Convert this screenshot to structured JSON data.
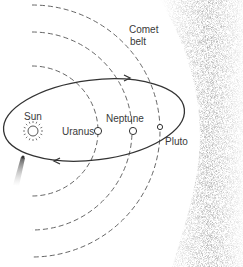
{
  "diagram": {
    "labels": {
      "sun": "Sun",
      "uranus": "Uranus",
      "neptune": "Neptune",
      "pluto": "Pluto",
      "comet_belt_line1": "Comet",
      "comet_belt_line2": "belt"
    },
    "colors": {
      "line": "#333333",
      "dashed_orbit": "#555555",
      "cloud": "#9a9a9a",
      "background": "#ffffff"
    }
  }
}
